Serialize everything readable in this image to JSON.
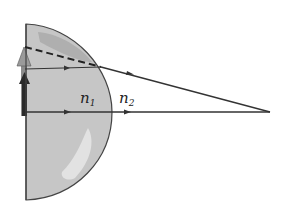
{
  "diagram": {
    "labels": {
      "n1": {
        "base": "n",
        "sub": "1"
      },
      "n2": {
        "base": "n",
        "sub": "2"
      }
    },
    "colors": {
      "lens_fill": "#c4c4c4",
      "lens_highlight": "#e2e2e2",
      "lens_shadow": "#a8a8a8",
      "object_arrow": "#8a8a8a",
      "image_arrow": "#2a2a2a",
      "ray": "#333333"
    }
  }
}
